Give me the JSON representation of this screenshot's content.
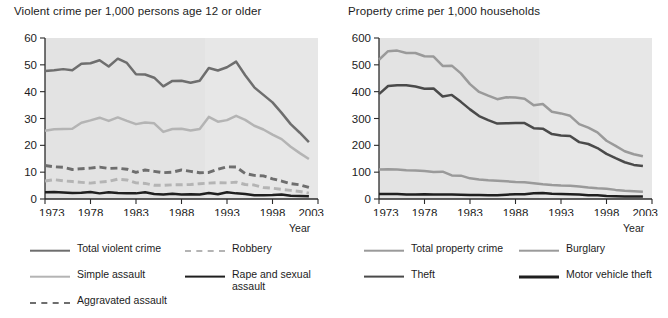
{
  "figure": {
    "axis_label": "Year",
    "background": "#e3e3e3",
    "colors": {
      "total_violent": "#6e6e6e",
      "simple_assault": "#b4b4b4",
      "aggravated_assault": "#6e6e6e",
      "robbery": "#b4b4b4",
      "rape_sexual": "#1f1f1f",
      "total_property": "#9a9a9a",
      "burglary": "#9a9a9a",
      "theft": "#4a4a4a",
      "motor_vehicle_theft": "#1f1f1f"
    }
  },
  "panels": [
    {
      "id": "violent",
      "title": "Violent crime per 1,000 persons age 12 or older",
      "axis_label": "Year",
      "legend": [
        {
          "label": "Total violent crime",
          "color": "#6e6e6e",
          "dash": false,
          "width": 2.6,
          "col": 0,
          "row": 0
        },
        {
          "label": "Simple assault",
          "color": "#b4b4b4",
          "dash": false,
          "width": 2.6,
          "col": 0,
          "row": 1
        },
        {
          "label": "Aggravated assault",
          "color": "#6e6e6e",
          "dash": true,
          "width": 2.8,
          "col": 0,
          "row": 2
        },
        {
          "label": "Robbery",
          "color": "#b4b4b4",
          "dash": true,
          "width": 2.8,
          "col": 1,
          "row": 0
        },
        {
          "label": "Rape and sexual assault",
          "color": "#1f1f1f",
          "dash": false,
          "width": 2.8,
          "col": 1,
          "row": 1
        }
      ]
    },
    {
      "id": "property",
      "title": "Property crime per 1,000 households",
      "axis_label": "Year",
      "legend": [
        {
          "label": "Total property crime",
          "color": "#9a9a9a",
          "dash": false,
          "width": 2.6,
          "col": 0,
          "row": 0
        },
        {
          "label": "Theft",
          "color": "#4a4a4a",
          "dash": false,
          "width": 2.8,
          "col": 0,
          "row": 1
        },
        {
          "label": "Burglary",
          "color": "#9a9a9a",
          "dash": false,
          "width": 2.6,
          "col": 1,
          "row": 0
        },
        {
          "label": "Motor vehicle theft",
          "color": "#1f1f1f",
          "dash": false,
          "width": 3.0,
          "col": 1,
          "row": 1
        }
      ]
    }
  ],
  "chart_data": [
    {
      "type": "line",
      "title": "Violent crime per 1,000 persons age 12 or older",
      "xlabel": "Year",
      "ylabel": "",
      "xlim": [
        1973,
        2003
      ],
      "ylim": [
        0,
        60
      ],
      "yticks": [
        0,
        10,
        20,
        30,
        40,
        50,
        60
      ],
      "xticks": [
        1973,
        1978,
        1983,
        1988,
        1993,
        1998,
        2003
      ],
      "grid": false,
      "legend_position": "below",
      "x": [
        1973,
        1974,
        1975,
        1976,
        1977,
        1978,
        1979,
        1980,
        1981,
        1982,
        1983,
        1984,
        1985,
        1986,
        1987,
        1988,
        1989,
        1990,
        1991,
        1992,
        1993,
        1994,
        1995,
        1996,
        1997,
        1998,
        1999,
        2000,
        2001,
        2002
      ],
      "series": [
        {
          "name": "Total violent crime",
          "style": "solid",
          "color": "#6e6e6e",
          "values": [
            47.7,
            48.0,
            48.4,
            48.0,
            50.4,
            50.6,
            51.7,
            49.4,
            52.3,
            50.7,
            46.5,
            46.4,
            45.2,
            42.0,
            44.0,
            44.1,
            43.3,
            44.1,
            48.8,
            47.9,
            49.1,
            51.2,
            46.1,
            41.6,
            38.8,
            36.0,
            32.1,
            27.9,
            24.7,
            21.2
          ]
        },
        {
          "name": "Simple assault",
          "style": "solid",
          "color": "#b4b4b4",
          "values": [
            25.4,
            26.0,
            26.1,
            26.2,
            28.4,
            29.3,
            30.3,
            29.1,
            30.4,
            29.1,
            27.9,
            28.5,
            28.2,
            25.0,
            26.1,
            26.2,
            25.5,
            26.1,
            30.6,
            28.8,
            29.4,
            31.0,
            29.5,
            27.3,
            25.9,
            24.0,
            22.3,
            19.5,
            17.1,
            14.9
          ]
        },
        {
          "name": "Aggravated assault",
          "style": "dashed",
          "color": "#6e6e6e",
          "values": [
            12.5,
            12.0,
            11.8,
            11.0,
            11.3,
            11.5,
            11.9,
            11.4,
            11.5,
            11.1,
            9.9,
            10.8,
            10.3,
            9.8,
            10.0,
            10.8,
            10.3,
            9.8,
            9.9,
            11.1,
            12.0,
            11.9,
            9.5,
            8.8,
            8.6,
            7.5,
            6.7,
            5.7,
            5.3,
            4.3
          ]
        },
        {
          "name": "Robbery",
          "style": "dashed",
          "color": "#b4b4b4",
          "values": [
            6.7,
            7.2,
            6.8,
            6.5,
            6.2,
            5.9,
            6.3,
            6.6,
            7.4,
            7.1,
            6.0,
            5.8,
            5.1,
            5.1,
            5.3,
            5.3,
            5.4,
            5.7,
            5.9,
            6.1,
            6.0,
            6.3,
            5.4,
            5.2,
            4.3,
            4.0,
            3.6,
            3.2,
            2.8,
            2.2
          ]
        },
        {
          "name": "Rape and sexual assault",
          "style": "solid",
          "color": "#1f1f1f",
          "values": [
            2.5,
            2.6,
            2.4,
            2.2,
            2.3,
            2.6,
            2.1,
            2.5,
            2.2,
            2.1,
            2.1,
            2.5,
            1.9,
            1.7,
            2.0,
            1.7,
            1.8,
            1.7,
            2.2,
            1.8,
            2.5,
            2.1,
            1.9,
            1.4,
            1.4,
            1.5,
            1.7,
            1.2,
            1.1,
            1.0
          ]
        }
      ]
    },
    {
      "type": "line",
      "title": "Property crime per 1,000 households",
      "xlabel": "Year",
      "ylabel": "",
      "xlim": [
        1973,
        2003
      ],
      "ylim": [
        0,
        600
      ],
      "yticks": [
        0,
        100,
        200,
        300,
        400,
        500,
        600
      ],
      "xticks": [
        1973,
        1978,
        1983,
        1988,
        1993,
        1998,
        2003
      ],
      "grid": false,
      "legend_position": "below",
      "x": [
        1973,
        1974,
        1975,
        1976,
        1977,
        1978,
        1979,
        1980,
        1981,
        1982,
        1983,
        1984,
        1985,
        1986,
        1987,
        1988,
        1989,
        1990,
        1991,
        1992,
        1993,
        1994,
        1995,
        1996,
        1997,
        1998,
        1999,
        2000,
        2001,
        2002
      ],
      "series": [
        {
          "name": "Total property crime",
          "style": "solid",
          "color": "#9a9a9a",
          "values": [
            519,
            551,
            553,
            544,
            544,
            532,
            531,
            496,
            497,
            468,
            428,
            399,
            385,
            372,
            379,
            378,
            374,
            349,
            354,
            325,
            319,
            310,
            279,
            266,
            248,
            217,
            198,
            178,
            167,
            159
          ]
        },
        {
          "name": "Theft",
          "style": "solid",
          "color": "#4a4a4a",
          "values": [
            391,
            421,
            424,
            424,
            419,
            411,
            412,
            382,
            388,
            362,
            334,
            309,
            294,
            281,
            282,
            283,
            283,
            264,
            262,
            242,
            237,
            235,
            212,
            205,
            190,
            168,
            152,
            137,
            127,
            123
          ]
        },
        {
          "name": "Burglary",
          "style": "solid",
          "color": "#9a9a9a",
          "values": [
            110,
            111,
            110,
            107,
            106,
            104,
            101,
            102,
            88,
            87,
            77,
            73,
            70,
            68,
            66,
            63,
            62,
            59,
            55,
            52,
            50,
            49,
            47,
            43,
            40,
            38,
            34,
            31,
            29,
            27
          ]
        },
        {
          "name": "Motor vehicle theft",
          "style": "solid",
          "color": "#1f1f1f",
          "values": [
            19,
            19,
            19,
            17,
            17,
            18,
            17,
            17,
            17,
            16,
            15,
            15,
            14,
            14,
            16,
            18,
            18,
            21,
            22,
            20,
            19,
            18,
            17,
            14,
            14,
            11,
            10,
            9,
            9,
            9
          ]
        }
      ]
    }
  ]
}
